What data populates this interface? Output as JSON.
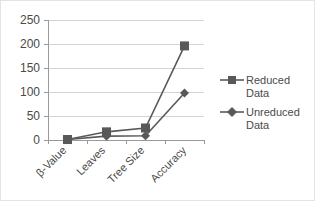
{
  "chart_data": {
    "type": "line",
    "title": "",
    "xlabel": "",
    "ylabel": "",
    "categories": [
      "β-Value",
      "Leaves",
      "Tree Size",
      "Accuracy"
    ],
    "series": [
      {
        "name": "Reduced Data",
        "marker": "square",
        "color": "#595959",
        "values": [
          1,
          17,
          25,
          196
        ]
      },
      {
        "name": "Unreduced Data",
        "marker": "diamond",
        "color": "#595959",
        "values": [
          1,
          8,
          9,
          98
        ]
      }
    ],
    "ylim": [
      0,
      250
    ],
    "yticks": [
      0,
      50,
      100,
      150,
      200,
      250
    ],
    "ytick_labels": [
      "0",
      "50",
      "100",
      "150",
      "200",
      "250"
    ],
    "grid": true,
    "legend_position": "right",
    "xtick_rotation": -45
  },
  "legend": {
    "items": [
      {
        "label_line1": "Reduced",
        "label_line2": "Data",
        "marker": "square-marker-icon"
      },
      {
        "label_line1": "Unreduced",
        "label_line2": "Data",
        "marker": "diamond-marker-icon"
      }
    ]
  },
  "colors": {
    "series": "#595959",
    "gridline": "#d3d3d3",
    "axis": "#9a9a9a",
    "text": "#4a4a4a",
    "background": "#ffffff",
    "border": "#e3e3e3"
  }
}
